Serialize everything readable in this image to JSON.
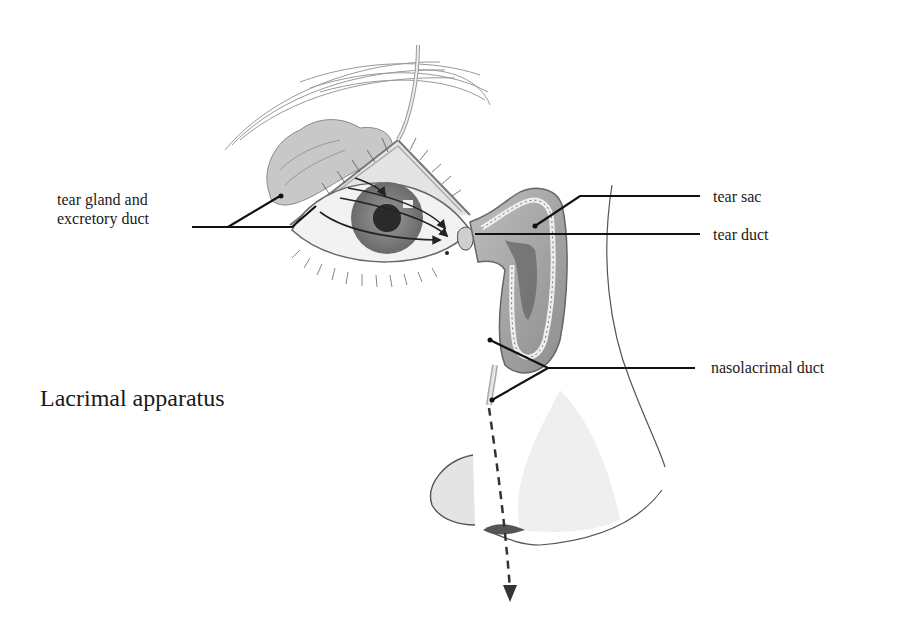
{
  "figure": {
    "title": "Lacrimal apparatus",
    "labels": {
      "tear_gland_line1": "tear gland and",
      "tear_gland_line2": "excretory duct",
      "tear_sac": "tear sac",
      "tear_duct": "tear duct",
      "nasolacrimal_duct": "nasolacrimal duct"
    },
    "colors": {
      "ink": "#1a1a1a",
      "shade_light": "#d8d8d8",
      "shade_mid": "#a8a8a8",
      "shade_dark": "#555555",
      "background": "#ffffff"
    }
  }
}
